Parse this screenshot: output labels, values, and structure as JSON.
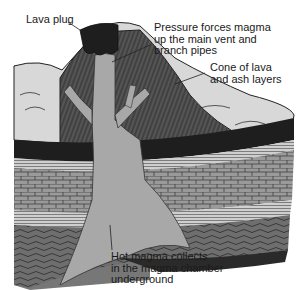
{
  "diagram": {
    "labels": {
      "lava_plug": "Lava plug",
      "pressure": "Pressure forces magma\nup the main vent and\nbranch pipes",
      "cone": "Cone of lava\nand ash layers",
      "chamber": "Hot magma collects\nin the magma chamber\nunderground"
    },
    "colors": {
      "magma": "#a8a8a8",
      "cone_dark": "#4a4a4a",
      "lava_plug": "#1e1e1e",
      "ash_surface": "#d8d8d8",
      "rock_layer": "#8c8c8c",
      "text": "#1a1a1a"
    }
  }
}
